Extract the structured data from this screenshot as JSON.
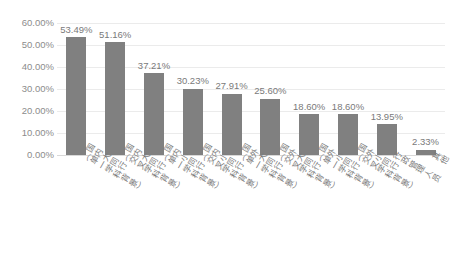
{
  "chart_data": {
    "type": "bar",
    "title": "",
    "subtitle": "",
    "xlabel": "",
    "ylabel": "",
    "ylim": [
      0,
      60
    ],
    "ytick_step": 10,
    "grid": true,
    "legend": "none",
    "series_color": "#808080",
    "value_suffix": "%",
    "categories": [
      "国内大同行（单一学科背景）",
      "国内大同行（交叉学科背景）",
      "国内小同行（单一学科背景）",
      "国内小同行（交叉学科背景）",
      "国外大同行（单一学科背景）",
      "国外大同行（交叉学科背景）",
      "国外小同行（单一学科背景）",
      "国外小同行（交叉学科背景）",
      "行政管理人员",
      "其他"
    ],
    "category_lines": [
      [
        "国内大同行",
        "（单一学科背景）"
      ],
      [
        "国内大同行",
        "（交叉学科背景）"
      ],
      [
        "国内小同行",
        "（单一学科背景）"
      ],
      [
        "国内小同行",
        "（交叉学科背景）"
      ],
      [
        "国外大同行",
        "（单一学科背景）"
      ],
      [
        "国外大同行",
        "（交叉学科背景）"
      ],
      [
        "国外小同行",
        "（单一学科背景）"
      ],
      [
        "国外小同行",
        "（交叉学科背景）"
      ],
      [
        "行政管理人员",
        ""
      ],
      [
        "其他",
        ""
      ]
    ],
    "values": [
      53.49,
      51.16,
      37.21,
      30.23,
      27.91,
      25.6,
      18.6,
      18.6,
      13.95,
      2.33
    ],
    "data_labels": [
      "53.49%",
      "51.16%",
      "37.21%",
      "30.23%",
      "27.91%",
      "25.60%",
      "18.60%",
      "18.60%",
      "13.95%",
      "2.33%"
    ],
    "ytick_labels": [
      "60.00%",
      "50.00%",
      "40.00%",
      "30.00%",
      "20.00%",
      "10.00%",
      "0.00%"
    ],
    "ytick_values": [
      60,
      50,
      40,
      30,
      20,
      10,
      0
    ]
  }
}
